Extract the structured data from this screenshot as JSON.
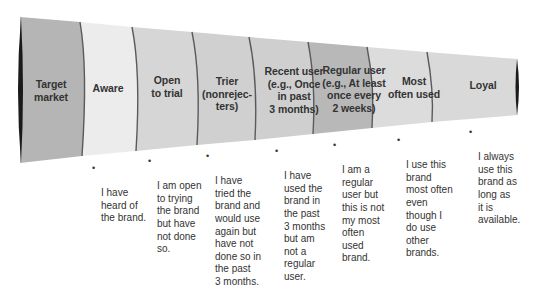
{
  "diagram": {
    "type": "funnel",
    "colors": {
      "dark_stage": "#b3b3b3",
      "light_stage": "#e8e8e8",
      "mid_stage": "#cfcfcf",
      "divider": "#555555",
      "end_cap": "#1a1a1a",
      "text": "#333333"
    },
    "stages": [
      {
        "label": "Target\nmarket",
        "description": ""
      },
      {
        "label": "Aware",
        "description": "I have\nheard of\nthe brand."
      },
      {
        "label": "Open\nto trial",
        "description": "I am open\nto trying\nthe brand\nbut have\nnot done\nso."
      },
      {
        "label": "Trier\n(nonrejec-\nters)",
        "description": "I have\ntried the\nbrand and\nwould use\nagain but\nhave not\ndone so in\nthe past\n3 months."
      },
      {
        "label": "Recent user\n(e.g., Once\nin past\n3 months)",
        "description": "I have\nused the\nbrand in\nthe past\n3 months\nbut am\nnot a\nregular\nuser."
      },
      {
        "label": "Regular user\n(e.g., At least\nonce every\n2 weeks)",
        "description": "I am a\nregular\nuser but\nthis is not\nmy most\noften\nused\nbrand."
      },
      {
        "label": "Most\noften used",
        "description": "I use this\nbrand\nmost often\neven\nthough I\ndo use\nother\nbrands."
      },
      {
        "label": "Loyal",
        "description": "I always\nuse this\nbrand as\nlong as\nit is\navailable."
      }
    ],
    "bullet_symbol": "•"
  }
}
